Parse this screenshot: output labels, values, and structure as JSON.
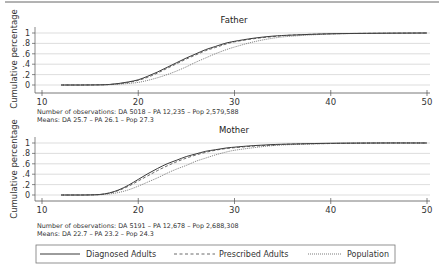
{
  "chart_data": [
    {
      "type": "line",
      "title": "Father",
      "xlabel": "",
      "ylabel": "Cumulative percentage",
      "xlim": [
        10,
        50
      ],
      "ylim": [
        0,
        1
      ],
      "xticks": [
        "10",
        "20",
        "30",
        "40",
        "50"
      ],
      "yticks": [
        "0",
        ".2",
        ".4",
        ".6",
        ".8",
        "1"
      ],
      "grid": true,
      "note_lines": [
        "Number of observations: DA 5018 – PA 12,235 – Pop 2,579,588",
        "Means: DA 25.7 – PA 26.1 – Pop 27.3"
      ],
      "x": [
        12,
        14,
        16,
        17,
        18,
        19,
        20,
        21,
        22,
        23,
        24,
        25,
        26,
        27,
        28,
        29,
        30,
        32,
        34,
        36,
        40,
        45,
        50
      ],
      "series": [
        {
          "name": "Diagnosed Adults",
          "style": "solid",
          "values": [
            0,
            0,
            0.003,
            0.01,
            0.03,
            0.06,
            0.1,
            0.17,
            0.25,
            0.34,
            0.43,
            0.52,
            0.6,
            0.68,
            0.74,
            0.8,
            0.84,
            0.9,
            0.94,
            0.96,
            0.985,
            0.995,
            1
          ]
        },
        {
          "name": "Prescribed Adults",
          "style": "dashed",
          "values": [
            0,
            0,
            0.003,
            0.01,
            0.025,
            0.05,
            0.09,
            0.15,
            0.23,
            0.32,
            0.41,
            0.5,
            0.58,
            0.66,
            0.72,
            0.78,
            0.83,
            0.89,
            0.93,
            0.96,
            0.985,
            0.995,
            1
          ]
        },
        {
          "name": "Population",
          "style": "dotted",
          "values": [
            0,
            0,
            0.002,
            0.006,
            0.015,
            0.03,
            0.05,
            0.09,
            0.14,
            0.2,
            0.27,
            0.35,
            0.44,
            0.52,
            0.6,
            0.67,
            0.73,
            0.83,
            0.9,
            0.94,
            0.98,
            0.995,
            1
          ]
        }
      ]
    },
    {
      "type": "line",
      "title": "Mother",
      "xlabel": "",
      "ylabel": "Cumulative percentage",
      "xlim": [
        10,
        50
      ],
      "ylim": [
        0,
        1
      ],
      "xticks": [
        "10",
        "20",
        "30",
        "40",
        "50"
      ],
      "yticks": [
        "0",
        ".2",
        ".4",
        ".6",
        ".8",
        "1"
      ],
      "grid": true,
      "note_lines": [
        "Number of observations: DA 5191 – PA 12,678 – Pop 2,688,308",
        "Means: DA 22.7 – PA 23.2 – Pop 24.3"
      ],
      "x": [
        12,
        14,
        15,
        16,
        17,
        18,
        19,
        20,
        21,
        22,
        23,
        24,
        25,
        26,
        27,
        28,
        29,
        30,
        32,
        34,
        36,
        40,
        45,
        50
      ],
      "series": [
        {
          "name": "Diagnosed Adults",
          "style": "solid",
          "values": [
            0,
            0,
            0.002,
            0.01,
            0.04,
            0.1,
            0.19,
            0.3,
            0.41,
            0.51,
            0.6,
            0.67,
            0.74,
            0.79,
            0.84,
            0.87,
            0.9,
            0.92,
            0.95,
            0.97,
            0.98,
            0.995,
            1,
            1
          ]
        },
        {
          "name": "Prescribed Adults",
          "style": "dashed",
          "values": [
            0,
            0,
            0.002,
            0.008,
            0.035,
            0.09,
            0.17,
            0.27,
            0.37,
            0.47,
            0.56,
            0.64,
            0.71,
            0.77,
            0.82,
            0.86,
            0.89,
            0.91,
            0.94,
            0.96,
            0.98,
            0.99,
            1,
            1
          ]
        },
        {
          "name": "Population",
          "style": "dotted",
          "values": [
            0,
            0,
            0.001,
            0.005,
            0.02,
            0.05,
            0.1,
            0.17,
            0.25,
            0.33,
            0.42,
            0.5,
            0.57,
            0.65,
            0.71,
            0.77,
            0.82,
            0.86,
            0.91,
            0.95,
            0.97,
            0.99,
            1,
            1
          ]
        }
      ]
    }
  ],
  "legend": {
    "placement": "bottom",
    "items": [
      {
        "label": "Diagnosed Adults",
        "style": "solid"
      },
      {
        "label": "Prescribed Adults",
        "style": "dashed"
      },
      {
        "label": "Population",
        "style": "dotted"
      }
    ]
  }
}
